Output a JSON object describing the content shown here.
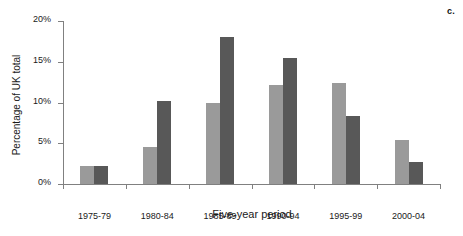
{
  "panel": {
    "label": "c."
  },
  "chart_data": {
    "type": "bar",
    "title": "",
    "subtitle": "",
    "xlabel": "Five-year period",
    "ylabel": "Percentage of UK total",
    "categories": [
      "1975-79",
      "1980-84",
      "1985-89",
      "1990-94",
      "1995-99",
      "2000-04"
    ],
    "series": [
      {
        "name": "series-1",
        "color": "#9a9a9a",
        "values": [
          2.2,
          4.5,
          10.0,
          12.1,
          12.4,
          5.4
        ]
      },
      {
        "name": "series-2",
        "color": "#585858",
        "values": [
          2.2,
          10.2,
          18.1,
          15.5,
          8.3,
          2.7
        ]
      }
    ],
    "ylim": [
      0,
      20
    ],
    "ytick_values": [
      0,
      5,
      10,
      15,
      20
    ],
    "ytick_labels": [
      "0%",
      "5%",
      "10%",
      "15%",
      "20%"
    ],
    "grid": false,
    "legend": "none",
    "axis_color": "#808080"
  }
}
